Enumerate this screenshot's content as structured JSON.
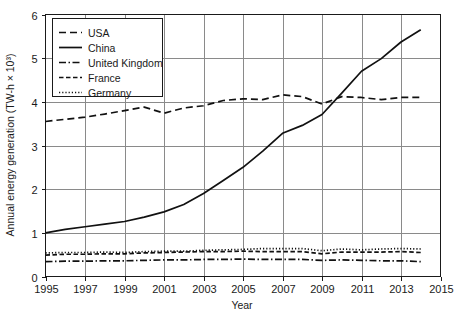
{
  "chart_data": {
    "type": "line",
    "title": "",
    "xlabel": "Year",
    "ylabel": "Annual energy generation (TW-h × 10³)",
    "xlim": [
      1995,
      2015
    ],
    "ylim": [
      0,
      6
    ],
    "xticks": [
      1995,
      1997,
      1999,
      2001,
      2003,
      2005,
      2007,
      2009,
      2011,
      2013,
      2015
    ],
    "yticks": [
      0,
      1,
      2,
      3,
      4,
      5,
      6
    ],
    "xtick_labels": [
      "1995",
      "1997",
      "1999",
      "2001",
      "2003",
      "2005",
      "2007",
      "2009",
      "2011",
      "2013",
      "2015"
    ],
    "ytick_labels": [
      "0",
      "1",
      "2",
      "3",
      "4",
      "5",
      "6"
    ],
    "grid": true,
    "legend_position": "upper left",
    "x": [
      1995,
      1996,
      1997,
      1998,
      1999,
      2000,
      2001,
      2002,
      2003,
      2004,
      2005,
      2006,
      2007,
      2008,
      2009,
      2010,
      2011,
      2012,
      2013,
      2014
    ],
    "series": [
      {
        "name": "USA",
        "style": "dashed",
        "color": "#111111",
        "values": [
          3.55,
          3.6,
          3.65,
          3.72,
          3.8,
          3.88,
          3.74,
          3.86,
          3.91,
          4.03,
          4.07,
          4.05,
          4.16,
          4.12,
          3.95,
          4.12,
          4.1,
          4.05,
          4.1,
          4.1
        ]
      },
      {
        "name": "China",
        "style": "solid",
        "color": "#111111",
        "values": [
          1.0,
          1.08,
          1.14,
          1.2,
          1.26,
          1.36,
          1.48,
          1.65,
          1.9,
          2.2,
          2.5,
          2.87,
          3.28,
          3.46,
          3.71,
          4.2,
          4.7,
          4.99,
          5.37,
          5.65
        ]
      },
      {
        "name": "United Kingdom",
        "style": "dashdot",
        "color": "#111111",
        "values": [
          0.34,
          0.35,
          0.35,
          0.36,
          0.36,
          0.37,
          0.38,
          0.38,
          0.39,
          0.39,
          0.4,
          0.39,
          0.39,
          0.39,
          0.37,
          0.38,
          0.37,
          0.36,
          0.36,
          0.34
        ]
      },
      {
        "name": "France",
        "style": "dashed-short",
        "color": "#111111",
        "values": [
          0.49,
          0.51,
          0.51,
          0.52,
          0.52,
          0.54,
          0.55,
          0.56,
          0.57,
          0.57,
          0.58,
          0.57,
          0.57,
          0.57,
          0.52,
          0.56,
          0.56,
          0.56,
          0.57,
          0.55
        ]
      },
      {
        "name": "Germany",
        "style": "dotted",
        "color": "#111111",
        "values": [
          0.54,
          0.55,
          0.55,
          0.56,
          0.55,
          0.57,
          0.58,
          0.58,
          0.6,
          0.61,
          0.62,
          0.64,
          0.64,
          0.64,
          0.59,
          0.63,
          0.61,
          0.63,
          0.64,
          0.63
        ]
      }
    ],
    "legend_entries": [
      {
        "label": "USA",
        "style": "dashed"
      },
      {
        "label": "China",
        "style": "solid"
      },
      {
        "label": "United Kingdom",
        "style": "dashdot"
      },
      {
        "label": "France",
        "style": "dashed-short"
      },
      {
        "label": "Germany",
        "style": "dotted"
      }
    ]
  }
}
